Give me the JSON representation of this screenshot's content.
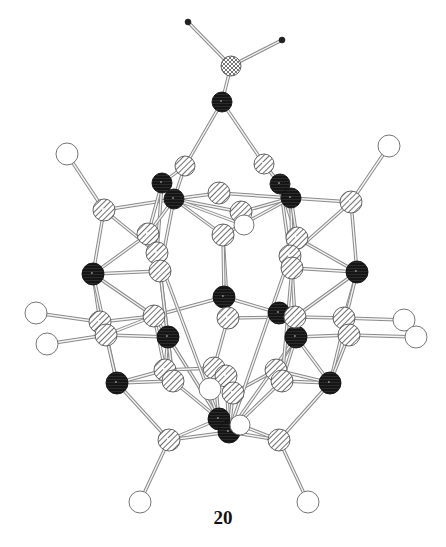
{
  "figure": {
    "label": "20",
    "type": "ball-and-stick molecular structure",
    "legend": {
      "black_hatched": "dark atom (e.g. metal)",
      "diagonal_hatched": "light-hatched atom (e.g. B/C cage atom)",
      "open_circle": "open atom (e.g. H)",
      "small_dot": "terminal small atom",
      "cross_hatched": "apex atom"
    },
    "colors": {
      "bond": "#9a9a9a",
      "dark": "#1a1a1a",
      "hatch": "#6f6f6f",
      "open_fill": "#ffffff",
      "outline": "#555555"
    },
    "atoms": [
      {
        "id": "t1",
        "x": 188,
        "y": 22,
        "r": 3,
        "kind": "dot"
      },
      {
        "id": "t2",
        "x": 282,
        "y": 40,
        "r": 3,
        "kind": "dot"
      },
      {
        "id": "a0",
        "x": 231,
        "y": 66,
        "r": 10,
        "kind": "cross"
      },
      {
        "id": "k0",
        "x": 222,
        "y": 102,
        "r": 10,
        "kind": "dark"
      },
      {
        "id": "h1",
        "x": 185,
        "y": 166,
        "r": 10,
        "kind": "hatch"
      },
      {
        "id": "h2",
        "x": 264,
        "y": 164,
        "r": 10,
        "kind": "hatch"
      },
      {
        "id": "d1",
        "x": 162,
        "y": 183,
        "r": 10,
        "kind": "dark"
      },
      {
        "id": "d2",
        "x": 174,
        "y": 199,
        "r": 10,
        "kind": "dark"
      },
      {
        "id": "d3",
        "x": 280,
        "y": 184,
        "r": 10,
        "kind": "dark"
      },
      {
        "id": "d4",
        "x": 291,
        "y": 198,
        "r": 10,
        "kind": "dark"
      },
      {
        "id": "o1",
        "x": 67,
        "y": 154,
        "r": 11,
        "kind": "open"
      },
      {
        "id": "o2",
        "x": 389,
        "y": 146,
        "r": 11,
        "kind": "open"
      },
      {
        "id": "h3",
        "x": 104,
        "y": 210,
        "r": 11,
        "kind": "hatch"
      },
      {
        "id": "h4",
        "x": 351,
        "y": 202,
        "r": 11,
        "kind": "hatch"
      },
      {
        "id": "h5",
        "x": 219,
        "y": 193,
        "r": 11,
        "kind": "hatch"
      },
      {
        "id": "h6",
        "x": 241,
        "y": 212,
        "r": 11,
        "kind": "hatch"
      },
      {
        "id": "o3",
        "x": 244,
        "y": 225,
        "r": 10,
        "kind": "open"
      },
      {
        "id": "h7",
        "x": 223,
        "y": 235,
        "r": 11,
        "kind": "hatch"
      },
      {
        "id": "h8",
        "x": 148,
        "y": 234,
        "r": 11,
        "kind": "hatch"
      },
      {
        "id": "h9",
        "x": 297,
        "y": 238,
        "r": 11,
        "kind": "hatch"
      },
      {
        "id": "h10",
        "x": 157,
        "y": 253,
        "r": 11,
        "kind": "hatch"
      },
      {
        "id": "h11",
        "x": 290,
        "y": 256,
        "r": 11,
        "kind": "hatch"
      },
      {
        "id": "h12",
        "x": 160,
        "y": 271,
        "r": 11,
        "kind": "hatch"
      },
      {
        "id": "h13",
        "x": 292,
        "y": 268,
        "r": 11,
        "kind": "hatch"
      },
      {
        "id": "d5",
        "x": 93,
        "y": 274,
        "r": 11,
        "kind": "dark"
      },
      {
        "id": "d6",
        "x": 357,
        "y": 272,
        "r": 11,
        "kind": "dark"
      },
      {
        "id": "d7",
        "x": 224,
        "y": 297,
        "r": 11,
        "kind": "dark"
      },
      {
        "id": "h14",
        "x": 228,
        "y": 318,
        "r": 11,
        "kind": "hatch"
      },
      {
        "id": "d8",
        "x": 279,
        "y": 313,
        "r": 11,
        "kind": "dark"
      },
      {
        "id": "d9",
        "x": 296,
        "y": 337,
        "r": 11,
        "kind": "dark"
      },
      {
        "id": "h15",
        "x": 154,
        "y": 316,
        "r": 11,
        "kind": "hatch"
      },
      {
        "id": "h16",
        "x": 295,
        "y": 317,
        "r": 11,
        "kind": "hatch"
      },
      {
        "id": "d10",
        "x": 168,
        "y": 337,
        "r": 11,
        "kind": "dark"
      },
      {
        "id": "h17",
        "x": 100,
        "y": 322,
        "r": 11,
        "kind": "hatch"
      },
      {
        "id": "h18",
        "x": 106,
        "y": 335,
        "r": 11,
        "kind": "hatch"
      },
      {
        "id": "h19",
        "x": 344,
        "y": 318,
        "r": 11,
        "kind": "hatch"
      },
      {
        "id": "h20",
        "x": 349,
        "y": 335,
        "r": 11,
        "kind": "hatch"
      },
      {
        "id": "o4",
        "x": 36,
        "y": 313,
        "r": 11,
        "kind": "open"
      },
      {
        "id": "o5",
        "x": 47,
        "y": 344,
        "r": 11,
        "kind": "open"
      },
      {
        "id": "o6",
        "x": 404,
        "y": 320,
        "r": 11,
        "kind": "open"
      },
      {
        "id": "o7",
        "x": 416,
        "y": 337,
        "r": 11,
        "kind": "open"
      },
      {
        "id": "d11",
        "x": 117,
        "y": 383,
        "r": 11,
        "kind": "dark"
      },
      {
        "id": "d12",
        "x": 330,
        "y": 383,
        "r": 11,
        "kind": "dark"
      },
      {
        "id": "h21",
        "x": 165,
        "y": 370,
        "r": 11,
        "kind": "hatch"
      },
      {
        "id": "h22",
        "x": 173,
        "y": 381,
        "r": 11,
        "kind": "hatch"
      },
      {
        "id": "h23",
        "x": 276,
        "y": 370,
        "r": 11,
        "kind": "hatch"
      },
      {
        "id": "h24",
        "x": 282,
        "y": 381,
        "r": 11,
        "kind": "hatch"
      },
      {
        "id": "h25",
        "x": 214,
        "y": 368,
        "r": 11,
        "kind": "hatch"
      },
      {
        "id": "h26",
        "x": 226,
        "y": 376,
        "r": 11,
        "kind": "hatch"
      },
      {
        "id": "o8",
        "x": 210,
        "y": 389,
        "r": 11,
        "kind": "open"
      },
      {
        "id": "h27",
        "x": 233,
        "y": 393,
        "r": 11,
        "kind": "hatch"
      },
      {
        "id": "d13",
        "x": 219,
        "y": 419,
        "r": 11,
        "kind": "dark"
      },
      {
        "id": "d14",
        "x": 229,
        "y": 432,
        "r": 11,
        "kind": "dark"
      },
      {
        "id": "o9",
        "x": 240,
        "y": 425,
        "r": 10,
        "kind": "open"
      },
      {
        "id": "h28",
        "x": 169,
        "y": 440,
        "r": 11,
        "kind": "hatch"
      },
      {
        "id": "h29",
        "x": 279,
        "y": 440,
        "r": 11,
        "kind": "hatch"
      },
      {
        "id": "o10",
        "x": 140,
        "y": 502,
        "r": 11,
        "kind": "open"
      },
      {
        "id": "o11",
        "x": 308,
        "y": 502,
        "r": 11,
        "kind": "open"
      }
    ],
    "bonds": [
      [
        "t1",
        "a0"
      ],
      [
        "t2",
        "a0"
      ],
      [
        "a0",
        "k0"
      ],
      [
        "k0",
        "h1"
      ],
      [
        "k0",
        "h2"
      ],
      [
        "h1",
        "d1"
      ],
      [
        "h1",
        "d2"
      ],
      [
        "h2",
        "d3"
      ],
      [
        "h2",
        "d4"
      ],
      [
        "o1",
        "h3"
      ],
      [
        "o2",
        "h4"
      ],
      [
        "h3",
        "d2"
      ],
      [
        "h4",
        "d4"
      ],
      [
        "h3",
        "d5"
      ],
      [
        "h4",
        "d6"
      ],
      [
        "d2",
        "h5"
      ],
      [
        "d4",
        "h5"
      ],
      [
        "d1",
        "h8"
      ],
      [
        "d1",
        "h10"
      ],
      [
        "d2",
        "h8"
      ],
      [
        "d2",
        "h6"
      ],
      [
        "d2",
        "h7"
      ],
      [
        "d2",
        "h12"
      ],
      [
        "d2",
        "o3"
      ],
      [
        "d3",
        "h9"
      ],
      [
        "d3",
        "h11"
      ],
      [
        "d4",
        "h6"
      ],
      [
        "d4",
        "h7"
      ],
      [
        "d4",
        "h13"
      ],
      [
        "d4",
        "h9"
      ],
      [
        "d5",
        "h8"
      ],
      [
        "d5",
        "h12"
      ],
      [
        "d5",
        "h15"
      ],
      [
        "d5",
        "h17"
      ],
      [
        "d5",
        "d11"
      ],
      [
        "d6",
        "h9"
      ],
      [
        "d6",
        "h13"
      ],
      [
        "d6",
        "h16"
      ],
      [
        "d6",
        "h19"
      ],
      [
        "d6",
        "d12"
      ],
      [
        "h7",
        "h14"
      ],
      [
        "h7",
        "d7"
      ],
      [
        "d7",
        "h15"
      ],
      [
        "d7",
        "d8"
      ],
      [
        "d7",
        "h14"
      ],
      [
        "h14",
        "h16"
      ],
      [
        "h14",
        "h25"
      ],
      [
        "h12",
        "d10"
      ],
      [
        "h13",
        "d9"
      ],
      [
        "h15",
        "h17"
      ],
      [
        "h15",
        "h18"
      ],
      [
        "h15",
        "h21"
      ],
      [
        "h15",
        "d10"
      ],
      [
        "h16",
        "h19"
      ],
      [
        "h16",
        "d9"
      ],
      [
        "h17",
        "o4"
      ],
      [
        "h18",
        "o5"
      ],
      [
        "h19",
        "o6"
      ],
      [
        "h20",
        "o7"
      ],
      [
        "h18",
        "d10"
      ],
      [
        "h20",
        "d9"
      ],
      [
        "h18",
        "d11"
      ],
      [
        "h20",
        "d12"
      ],
      [
        "d10",
        "h21"
      ],
      [
        "d10",
        "h22"
      ],
      [
        "d10",
        "d13"
      ],
      [
        "d9",
        "h23"
      ],
      [
        "d9",
        "h24"
      ],
      [
        "d9",
        "d14"
      ],
      [
        "d9",
        "d12"
      ],
      [
        "d11",
        "h21"
      ],
      [
        "d11",
        "h22"
      ],
      [
        "d11",
        "h28"
      ],
      [
        "d12",
        "h23"
      ],
      [
        "d12",
        "h24"
      ],
      [
        "d12",
        "h29"
      ],
      [
        "h22",
        "d13"
      ],
      [
        "h24",
        "d14"
      ],
      [
        "h25",
        "d13"
      ],
      [
        "h26",
        "d14"
      ],
      [
        "h27",
        "d14"
      ],
      [
        "h21",
        "h25"
      ],
      [
        "h23",
        "h27"
      ],
      [
        "h28",
        "d13"
      ],
      [
        "h28",
        "d14"
      ],
      [
        "h29",
        "d14"
      ],
      [
        "h29",
        "o9"
      ],
      [
        "h28",
        "o10"
      ],
      [
        "h29",
        "o11"
      ],
      [
        "h10",
        "d13"
      ],
      [
        "h11",
        "d14"
      ],
      [
        "h12",
        "h22"
      ],
      [
        "h13",
        "h24"
      ],
      [
        "h3",
        "h10"
      ],
      [
        "h4",
        "h11"
      ]
    ]
  }
}
